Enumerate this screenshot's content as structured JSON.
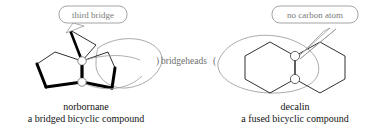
{
  "figure": {
    "background_color": "#ffffff",
    "bond_color": "#000000",
    "annotation_color": "#808080",
    "text_color": "#141414"
  },
  "left_structure": {
    "name_label": "norbornane",
    "description_label": "a bridged bicyclic compound",
    "callout": {
      "text": "third bridge",
      "shape": "rounded-rectangle-speech-bubble",
      "stroke_color": "#9a9a9a",
      "text_color": "#7c7c7c"
    },
    "markers": [
      {
        "name": "bridgehead-top",
        "shape": "circle"
      },
      {
        "name": "bridgehead-bottom",
        "shape": "circle"
      }
    ]
  },
  "center_annotation": {
    "text": "bridgeheads",
    "left_bracket": ")",
    "right_bracket": "(",
    "text_color": "#6f6f6f"
  },
  "right_structure": {
    "name_label": "decalin",
    "description_label": "a fused bicyclic compound",
    "callout": {
      "text": "no carbon atom",
      "shape": "rounded-rectangle-speech-bubble",
      "stroke_color": "#9a9a9a",
      "text_color": "#7c7c7c"
    },
    "markers": [
      {
        "name": "bridgehead-top",
        "shape": "circle"
      },
      {
        "name": "bridgehead-bottom",
        "shape": "circle"
      }
    ]
  }
}
